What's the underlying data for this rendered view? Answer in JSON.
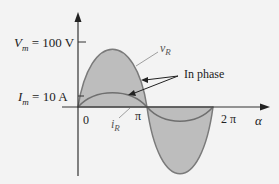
{
  "labels": {
    "vm_sym": "V",
    "vm_sub": "m",
    "vm_val": " = 100 V",
    "im_sym": "I",
    "im_sub": "m",
    "im_val": " = 10 A",
    "zero": "0",
    "pi": "π",
    "two_pi": "2 π",
    "alpha": "α",
    "vr_sym": "v",
    "vr_sub": "R",
    "ir_sym": "i",
    "ir_sub": "R",
    "in_phase": "In phase"
  },
  "colors": {
    "fill": "#bdbdbd",
    "curve": "#7a7a7a",
    "axis": "#333333",
    "background": "#f3f3f3"
  }
}
